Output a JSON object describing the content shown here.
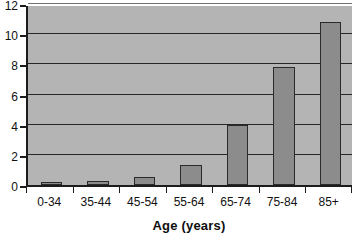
{
  "chart_data": {
    "type": "bar",
    "title": "",
    "subtitle": "",
    "xlabel": "Age (years)",
    "ylabel": "",
    "categories": [
      "0-34",
      "35-44",
      "45-54",
      "55-64",
      "65-74",
      "75-84",
      "85+"
    ],
    "values": [
      0.07,
      0.25,
      0.5,
      1.35,
      3.95,
      7.8,
      10.8
    ],
    "series": [
      {
        "name": "",
        "values": [
          0.07,
          0.25,
          0.5,
          1.35,
          3.95,
          7.8,
          10.8
        ]
      }
    ],
    "ylim": [
      0,
      12
    ],
    "xlim": [
      0,
      7
    ],
    "y_ticks": [
      0,
      2,
      4,
      6,
      8,
      10,
      12
    ],
    "y_tick_labels": [
      "0",
      "2",
      "4",
      "6",
      "8",
      "10",
      "12"
    ],
    "x_tick_labels": [
      "0-34",
      "35-44",
      "45-54",
      "55-64",
      "65-74",
      "75-84",
      "85+"
    ],
    "grid": true,
    "grid_axis": "y",
    "legend": false,
    "legend_position": "none",
    "annotations": [],
    "colors": {
      "bar_fill": "#8c8c8c",
      "bar_border": "#2a2a2a",
      "plot_background": "#b4b4b4",
      "page_background": "#ffffff",
      "gridline": "#272727",
      "axis_line": "#1c1c1c",
      "text": "#111111"
    }
  }
}
